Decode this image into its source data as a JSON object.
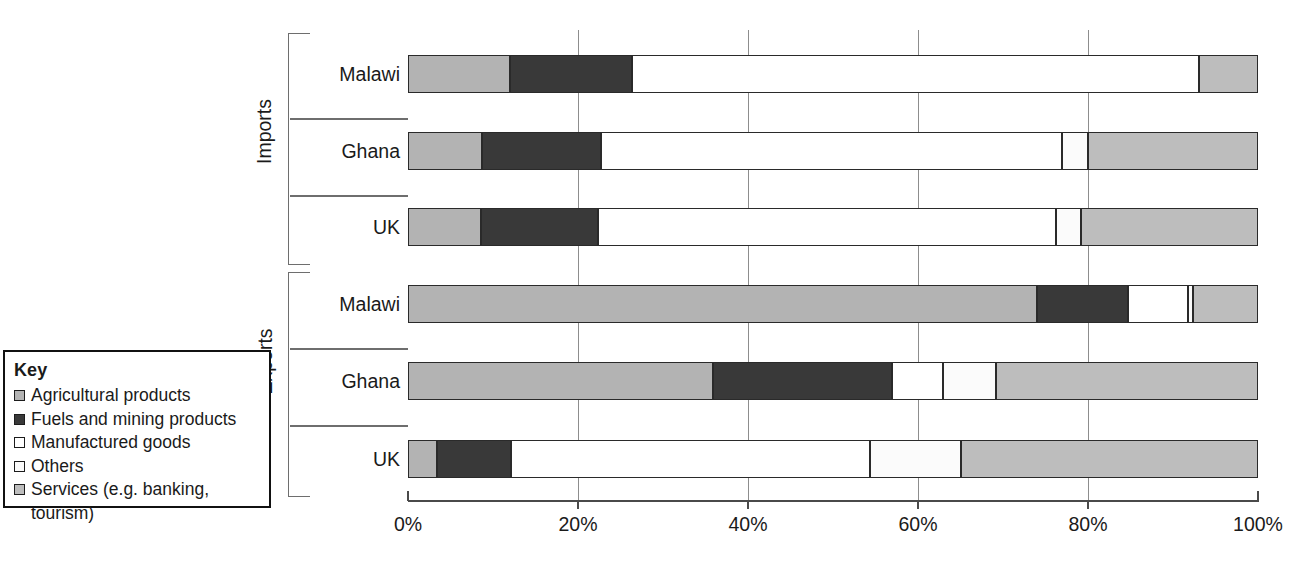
{
  "legend": {
    "title": "Key",
    "items": [
      {
        "label": "Agricultural products",
        "color": "#b3b3b3",
        "icon": "swatch-icon"
      },
      {
        "label": "Fuels and mining products",
        "color": "#393939",
        "icon": "swatch-icon"
      },
      {
        "label": "Manufactured goods",
        "color": "#ffffff",
        "icon": "swatch-icon"
      },
      {
        "label": "Others",
        "color": "#fbfbfb",
        "icon": "swatch-icon"
      },
      {
        "label": "Services (e.g. banking,\ntourism)",
        "color": "#bdbdbd",
        "icon": "swatch-icon"
      }
    ]
  },
  "axis": {
    "ticks": [
      "0%",
      "20%",
      "40%",
      "60%",
      "80%",
      "100%"
    ],
    "tick_values": [
      0,
      20,
      40,
      60,
      80,
      100
    ]
  },
  "groups": [
    {
      "name": "Imports"
    },
    {
      "name": "Exports"
    }
  ],
  "chart_data": {
    "type": "bar",
    "orientation": "horizontal",
    "stacked": true,
    "normalized": true,
    "title": "",
    "xlabel": "",
    "ylabel": "",
    "xlim": [
      0,
      100
    ],
    "grid": true,
    "legend_position": "left",
    "categories": [
      "Imports – Malawi",
      "Imports – Ghana",
      "Imports – UK",
      "Exports – Malawi",
      "Exports – Ghana",
      "Exports – UK"
    ],
    "series": [
      {
        "name": "Agricultural products",
        "color": "#b3b3b3",
        "values": [
          12.0,
          8.7,
          8.6,
          74.0,
          35.9,
          3.4
        ]
      },
      {
        "name": "Fuels and mining products",
        "color": "#393939",
        "values": [
          14.4,
          14.0,
          13.8,
          10.7,
          21.1,
          8.7
        ]
      },
      {
        "name": "Manufactured goods",
        "color": "#ffffff",
        "values": [
          66.7,
          54.3,
          53.8,
          7.1,
          5.9,
          42.3
        ]
      },
      {
        "name": "Others",
        "color": "#fbfbfb",
        "values": [
          0.0,
          3.0,
          3.0,
          0.6,
          6.3,
          10.7
        ]
      },
      {
        "name": "Services (e.g. banking, tourism)",
        "color": "#bdbdbd",
        "values": [
          6.9,
          20.0,
          20.8,
          7.6,
          30.8,
          34.9
        ]
      }
    ],
    "bars": [
      {
        "group": "Imports",
        "label": "Malawi",
        "segments": [
          {
            "name": "Agricultural products",
            "start": 0.0,
            "end": 12.0,
            "color": "#b3b3b3"
          },
          {
            "name": "Fuels and mining products",
            "start": 12.0,
            "end": 26.4,
            "color": "#393939"
          },
          {
            "name": "Manufactured goods",
            "start": 26.4,
            "end": 93.1,
            "color": "#ffffff"
          },
          {
            "name": "Services (e.g. banking, tourism)",
            "start": 93.1,
            "end": 100.0,
            "color": "#bdbdbd"
          }
        ]
      },
      {
        "group": "Imports",
        "label": "Ghana",
        "segments": [
          {
            "name": "Agricultural products",
            "start": 0.0,
            "end": 8.7,
            "color": "#b3b3b3"
          },
          {
            "name": "Fuels and mining products",
            "start": 8.7,
            "end": 22.7,
            "color": "#393939"
          },
          {
            "name": "Manufactured goods",
            "start": 22.7,
            "end": 77.0,
            "color": "#ffffff"
          },
          {
            "name": "Others",
            "start": 77.0,
            "end": 80.0,
            "color": "#fbfbfb"
          },
          {
            "name": "Services (e.g. banking, tourism)",
            "start": 80.0,
            "end": 100.0,
            "color": "#bdbdbd"
          }
        ]
      },
      {
        "group": "Imports",
        "label": "UK",
        "segments": [
          {
            "name": "Agricultural products",
            "start": 0.0,
            "end": 8.6,
            "color": "#b3b3b3"
          },
          {
            "name": "Fuels and mining products",
            "start": 8.6,
            "end": 22.4,
            "color": "#393939"
          },
          {
            "name": "Manufactured goods",
            "start": 22.4,
            "end": 76.2,
            "color": "#ffffff"
          },
          {
            "name": "Others",
            "start": 76.2,
            "end": 79.2,
            "color": "#fbfbfb"
          },
          {
            "name": "Services (e.g. banking, tourism)",
            "start": 79.2,
            "end": 100.0,
            "color": "#bdbdbd"
          }
        ]
      },
      {
        "group": "Exports",
        "label": "Malawi",
        "segments": [
          {
            "name": "Agricultural products",
            "start": 0.0,
            "end": 74.0,
            "color": "#b3b3b3"
          },
          {
            "name": "Fuels and mining products",
            "start": 74.0,
            "end": 84.7,
            "color": "#393939"
          },
          {
            "name": "Manufactured goods",
            "start": 84.7,
            "end": 91.8,
            "color": "#ffffff"
          },
          {
            "name": "Others",
            "start": 91.8,
            "end": 92.4,
            "color": "#fbfbfb"
          },
          {
            "name": "Services (e.g. banking, tourism)",
            "start": 92.4,
            "end": 100.0,
            "color": "#bdbdbd"
          }
        ]
      },
      {
        "group": "Exports",
        "label": "Ghana",
        "segments": [
          {
            "name": "Agricultural products",
            "start": 0.0,
            "end": 35.9,
            "color": "#b3b3b3"
          },
          {
            "name": "Fuels and mining products",
            "start": 35.9,
            "end": 57.0,
            "color": "#393939"
          },
          {
            "name": "Manufactured goods",
            "start": 57.0,
            "end": 62.9,
            "color": "#ffffff"
          },
          {
            "name": "Others",
            "start": 62.9,
            "end": 69.2,
            "color": "#fbfbfb"
          },
          {
            "name": "Services (e.g. banking, tourism)",
            "start": 69.2,
            "end": 100.0,
            "color": "#bdbdbd"
          }
        ]
      },
      {
        "group": "Exports",
        "label": "UK",
        "segments": [
          {
            "name": "Agricultural products",
            "start": 0.0,
            "end": 3.4,
            "color": "#b3b3b3"
          },
          {
            "name": "Fuels and mining products",
            "start": 3.4,
            "end": 12.1,
            "color": "#393939"
          },
          {
            "name": "Manufactured goods",
            "start": 12.1,
            "end": 54.4,
            "color": "#ffffff"
          },
          {
            "name": "Others",
            "start": 54.4,
            "end": 65.1,
            "color": "#fbfbfb"
          },
          {
            "name": "Services (e.g. banking, tourism)",
            "start": 65.1,
            "end": 100.0,
            "color": "#bdbdbd"
          }
        ]
      }
    ]
  }
}
